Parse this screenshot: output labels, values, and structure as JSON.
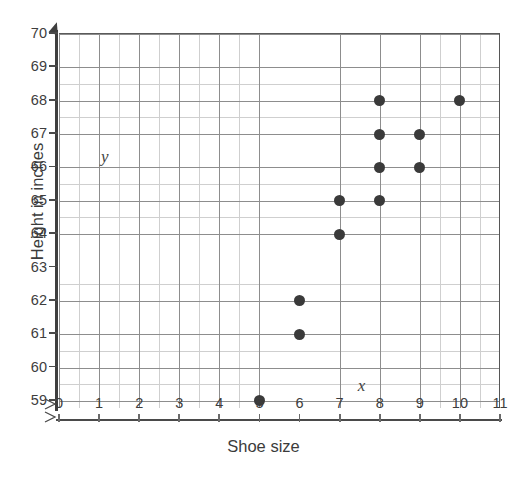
{
  "chart_data": {
    "type": "scatter",
    "title": "",
    "xlabel": "Shoe size",
    "ylabel": "Height in inches",
    "x_variable_label": "x",
    "y_variable_label": "y",
    "xlim": [
      0,
      11
    ],
    "ylim": [
      59,
      70
    ],
    "x_ticks": [
      "0",
      "1",
      "2",
      "3",
      "4",
      "5",
      "6",
      "7",
      "8",
      "9",
      "10",
      "11"
    ],
    "y_ticks": [
      "59",
      "60",
      "61",
      "62",
      "63",
      "64",
      "65",
      "66",
      "67",
      "68",
      "69",
      "70"
    ],
    "grid": true,
    "minor_grid": true,
    "legend": "none",
    "y_axis_break": true,
    "point_color": "#3a3a3a",
    "grid_color": "#8d8d8d",
    "minor_grid_color": "#cfcfcf",
    "axis_color": "#4a4a4a",
    "points": [
      {
        "x": 5,
        "y": 59
      },
      {
        "x": 6,
        "y": 61
      },
      {
        "x": 6,
        "y": 62
      },
      {
        "x": 7,
        "y": 64
      },
      {
        "x": 7,
        "y": 65
      },
      {
        "x": 8,
        "y": 65
      },
      {
        "x": 8,
        "y": 66
      },
      {
        "x": 8,
        "y": 67
      },
      {
        "x": 8,
        "y": 68
      },
      {
        "x": 9,
        "y": 66
      },
      {
        "x": 9,
        "y": 67
      },
      {
        "x": 10,
        "y": 68
      }
    ]
  }
}
